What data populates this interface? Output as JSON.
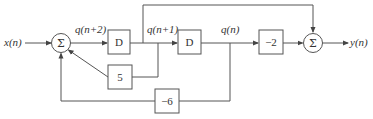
{
  "diagram": {
    "type": "block-diagram",
    "signals": {
      "input": "x(n)",
      "q2": "q(n+2)",
      "q1": "q(n+1)",
      "q0": "q(n)",
      "output": "y(n)"
    },
    "blocks": {
      "delay1": "D",
      "delay2": "D",
      "gain_neg2": "−2",
      "gain_5": "5",
      "gain_neg6": "−6"
    },
    "summers": {
      "sum1": "Σ",
      "sum2": "Σ"
    },
    "colors": {
      "line": "#555555",
      "text": "#333333",
      "background": "#ffffff"
    }
  }
}
